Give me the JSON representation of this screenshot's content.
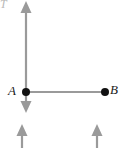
{
  "figure": {
    "background_color": "#ffffff",
    "line_color": "#9a9a9a",
    "point_color": "#111111",
    "label_color": "#1a1a1a",
    "faint_label_color": "#b9b9b9",
    "width": 124,
    "height": 148
  },
  "labels": {
    "point_a": "A",
    "point_b": "B",
    "top_left": "T"
  },
  "points": [
    {
      "name": "A",
      "x": 26,
      "y": 92,
      "radius": 4
    },
    {
      "name": "B",
      "x": 105,
      "y": 92,
      "radius": 4
    }
  ],
  "lines": [
    {
      "name": "vertical-axis",
      "x1": 26,
      "y1": 6,
      "x2": 26,
      "y2": 108
    },
    {
      "name": "horizontal-segment-ab",
      "x1": 26,
      "y1": 92,
      "x2": 105,
      "y2": 92
    }
  ],
  "arrows": [
    {
      "name": "arrow-up-top",
      "x": 26,
      "tail_y": 14,
      "tip_y": 1,
      "direction": "up"
    },
    {
      "name": "arrow-down-below-a",
      "x": 26,
      "tail_y": 100,
      "tip_y": 113,
      "direction": "down"
    },
    {
      "name": "arrow-up-bottom-left",
      "x": 22,
      "tail_y": 148,
      "tip_y": 124,
      "direction": "up"
    },
    {
      "name": "arrow-up-bottom-right",
      "x": 97,
      "tail_y": 148,
      "tip_y": 124,
      "direction": "up"
    }
  ]
}
